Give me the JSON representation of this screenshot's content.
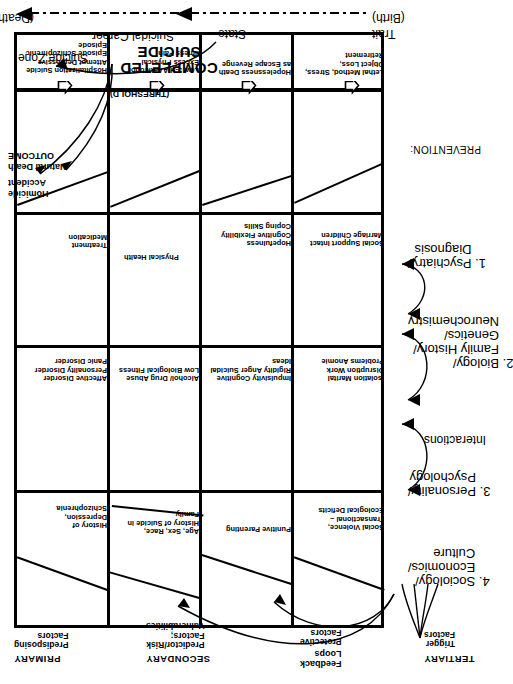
{
  "diagram": {
    "outcome": {
      "homicide": "Homicide",
      "accident": "Accident",
      "natural_death": "Natural Death",
      "outcome_label": "OUTCOME",
      "completed_suicide": "COMPLETED\nSUICIDE",
      "threshold": "(THRESHOLD)"
    },
    "stage_headers": [
      {
        "name": "PRIMARY",
        "sub": "Predisposing\nFactors"
      },
      {
        "name": "SECONDARY",
        "sub": "Predictor/Risk\nFactors;\nVulnerabilities"
      },
      {
        "name": "TERTIARY",
        "sub": "Trigger\nFactors"
      }
    ],
    "annotations": {
      "feedback_loops": "Feedback\nLoops",
      "protective_factors": "Protective\nFactors",
      "trigger_factors": "Trigger\nFactors",
      "suicide_zone": "Suicide Zone",
      "suicidal_career": "Suicidal Career"
    },
    "timeline": {
      "birth": "(Birth)",
      "death": "(Death)",
      "trait": "Trait",
      "state": "State"
    },
    "rows": [
      {
        "domain": "psychiatry",
        "primary": "History of\nDepression,\nSchizophrenia",
        "secondary": "Affective Disorder\nPersonality Disorder\nPanic Disorder",
        "protective": "Treatment\nMedication",
        "tertiary": "Hospitalization\nSuicide Attempt\nDepressive Episode\nSchizophrenic Episode"
      },
      {
        "domain": "biology",
        "primary": "Age,\nSex, Race,\nHistory of\nSuicide in Family",
        "secondary": "Alcohol/ Drug Abuse\nLow Biological\nFitness",
        "protective": "Physical Health",
        "tertiary": "Low 5-HIAA\nAlcohol Excess\nPhysical Illness\nPain"
      },
      {
        "domain": "personality",
        "primary": "Punitive\nParenting",
        "secondary": "Impulsivity\nCognitive Rigidity\nAnger\nSuicidal Ideas",
        "protective": "Hopefulness\nCognitive Flexibility\nCoping Skills",
        "tertiary": "Hopelessness\nDeath as Escape\nRevenge"
      },
      {
        "domain": "sociology",
        "primary": "Social\nViolence,\nTransactional –\nEcological Deficits",
        "secondary": "Isolation\nMarital Disruption\nWork Problems\nAnomie",
        "protective": "Social Support\nIntact Marriage\nChildren",
        "tertiary": "Lethal\nMethod,\nStress, Object Loss,\nRetirement"
      }
    ],
    "prevention": {
      "label": "PREVENTION:",
      "interactions": "Interactions",
      "items": [
        "1. Psychiatry/\n    Diagnosis",
        "2. Biology/\n    Family History/\n    Genetics/\n    Neurochemistry",
        "3. Personality/\n    Psychology",
        "4. Sociology/\n    Economics/\n    Culture"
      ]
    }
  },
  "colors": {
    "ink": "#000000",
    "paper": "#ffffff"
  }
}
